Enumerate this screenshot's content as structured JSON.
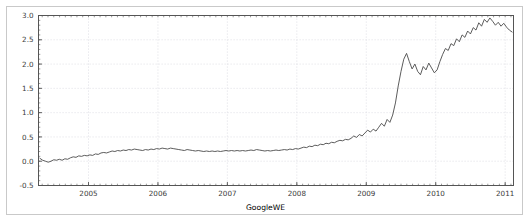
{
  "figure": {
    "background_color": "#ffffff",
    "frame_border_color": "#c9c9c9",
    "axes_color": "#555555",
    "grid_color": "#d8d8e0",
    "line_color": "#4a4a4a"
  },
  "chart_data": {
    "type": "line",
    "title": "",
    "subtitle": "",
    "xlabel": "GoogleWE",
    "ylabel": "",
    "xlim": [
      2004.28,
      2011.12
    ],
    "ylim": [
      -0.5,
      3.0
    ],
    "grid": true,
    "legend": null,
    "legend_position": "none",
    "xticks": [
      2005,
      2006,
      2007,
      2008,
      2009,
      2010,
      2011
    ],
    "xticklabels": [
      "2005",
      "2006",
      "2007",
      "2008",
      "2009",
      "2010",
      "2011"
    ],
    "yticks": [
      -0.5,
      0.0,
      0.5,
      1.0,
      1.5,
      2.0,
      2.5,
      3.0
    ],
    "yticklabels": [
      "-0.5",
      "0.0",
      "0.5",
      "1.0",
      "1.5",
      "2.0",
      "2.5",
      "3.0"
    ],
    "series": [
      {
        "name": "GoogleWE",
        "x": [
          2004.3,
          2004.34,
          2004.38,
          2004.42,
          2004.46,
          2004.5,
          2004.54,
          2004.58,
          2004.62,
          2004.66,
          2004.7,
          2004.74,
          2004.78,
          2004.82,
          2004.86,
          2004.9,
          2004.94,
          2004.98,
          2005.02,
          2005.06,
          2005.1,
          2005.14,
          2005.18,
          2005.22,
          2005.26,
          2005.3,
          2005.34,
          2005.38,
          2005.42,
          2005.46,
          2005.5,
          2005.54,
          2005.58,
          2005.62,
          2005.66,
          2005.7,
          2005.74,
          2005.78,
          2005.82,
          2005.86,
          2005.9,
          2005.94,
          2005.98,
          2006.02,
          2006.06,
          2006.1,
          2006.14,
          2006.18,
          2006.22,
          2006.26,
          2006.3,
          2006.34,
          2006.38,
          2006.42,
          2006.46,
          2006.5,
          2006.54,
          2006.58,
          2006.62,
          2006.66,
          2006.7,
          2006.74,
          2006.78,
          2006.82,
          2006.86,
          2006.9,
          2006.94,
          2006.98,
          2007.02,
          2007.06,
          2007.1,
          2007.14,
          2007.18,
          2007.22,
          2007.26,
          2007.3,
          2007.34,
          2007.38,
          2007.42,
          2007.46,
          2007.5,
          2007.54,
          2007.58,
          2007.62,
          2007.66,
          2007.7,
          2007.74,
          2007.78,
          2007.82,
          2007.86,
          2007.9,
          2007.94,
          2007.98,
          2008.02,
          2008.06,
          2008.1,
          2008.14,
          2008.18,
          2008.22,
          2008.26,
          2008.3,
          2008.34,
          2008.38,
          2008.42,
          2008.46,
          2008.5,
          2008.54,
          2008.58,
          2008.62,
          2008.66,
          2008.7,
          2008.74,
          2008.78,
          2008.82,
          2008.86,
          2008.9,
          2008.94,
          2008.98,
          2009.02,
          2009.06,
          2009.1,
          2009.14,
          2009.18,
          2009.22,
          2009.26,
          2009.3,
          2009.34,
          2009.38,
          2009.42,
          2009.46,
          2009.5,
          2009.54,
          2009.58,
          2009.62,
          2009.66,
          2009.7,
          2009.74,
          2009.78,
          2009.82,
          2009.86,
          2009.9,
          2009.94,
          2009.98,
          2010.02,
          2010.06,
          2010.1,
          2010.14,
          2010.18,
          2010.22,
          2010.26,
          2010.3,
          2010.34,
          2010.38,
          2010.42,
          2010.46,
          2010.5,
          2010.54,
          2010.58,
          2010.62,
          2010.66,
          2010.7,
          2010.74,
          2010.78,
          2010.82,
          2010.86,
          2010.9,
          2010.94,
          2010.98,
          2011.02,
          2011.06,
          2011.1
        ],
        "y": [
          0.06,
          0.02,
          0.0,
          -0.02,
          0.0,
          0.03,
          0.02,
          0.04,
          0.02,
          0.05,
          0.04,
          0.07,
          0.09,
          0.08,
          0.11,
          0.1,
          0.12,
          0.11,
          0.13,
          0.12,
          0.15,
          0.14,
          0.17,
          0.18,
          0.17,
          0.19,
          0.21,
          0.2,
          0.22,
          0.21,
          0.23,
          0.22,
          0.24,
          0.23,
          0.25,
          0.24,
          0.23,
          0.22,
          0.24,
          0.23,
          0.25,
          0.24,
          0.26,
          0.25,
          0.27,
          0.26,
          0.25,
          0.27,
          0.26,
          0.25,
          0.24,
          0.23,
          0.22,
          0.24,
          0.23,
          0.22,
          0.21,
          0.22,
          0.21,
          0.2,
          0.21,
          0.2,
          0.21,
          0.2,
          0.21,
          0.2,
          0.21,
          0.22,
          0.21,
          0.22,
          0.21,
          0.22,
          0.21,
          0.22,
          0.21,
          0.22,
          0.23,
          0.22,
          0.24,
          0.23,
          0.22,
          0.21,
          0.22,
          0.21,
          0.22,
          0.23,
          0.22,
          0.23,
          0.24,
          0.23,
          0.25,
          0.24,
          0.26,
          0.25,
          0.27,
          0.29,
          0.28,
          0.31,
          0.3,
          0.33,
          0.32,
          0.35,
          0.34,
          0.37,
          0.36,
          0.39,
          0.38,
          0.41,
          0.43,
          0.42,
          0.45,
          0.44,
          0.47,
          0.52,
          0.49,
          0.55,
          0.52,
          0.58,
          0.64,
          0.6,
          0.66,
          0.62,
          0.7,
          0.78,
          0.72,
          0.86,
          0.8,
          0.95,
          1.2,
          1.55,
          1.85,
          2.1,
          2.22,
          2.05,
          1.9,
          2.0,
          1.85,
          1.78,
          1.95,
          1.88,
          2.02,
          1.92,
          1.82,
          1.88,
          2.05,
          2.2,
          2.32,
          2.28,
          2.42,
          2.38,
          2.52,
          2.46,
          2.6,
          2.55,
          2.68,
          2.62,
          2.75,
          2.7,
          2.85,
          2.78,
          2.92,
          2.86,
          2.95,
          2.88,
          2.8,
          2.86,
          2.78,
          2.84,
          2.76,
          2.7,
          2.66
        ]
      }
    ]
  }
}
